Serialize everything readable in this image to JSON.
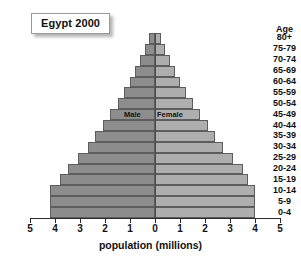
{
  "title": "Egypt 2000",
  "axis_label": "population (millions)",
  "age_header": "Age",
  "series_labels": {
    "male": "Male",
    "female": "Female"
  },
  "tick_labels": [
    "5",
    "4",
    "3",
    "2",
    "1",
    "0",
    "1",
    "2",
    "3",
    "4",
    "5"
  ],
  "colors": {
    "male_bar": "#8d8d8d",
    "female_bar": "#aeaeae",
    "bar_outline": "#5d5d5d",
    "axis": "#2b2b2b",
    "background": "#ffffff"
  },
  "chart_data": {
    "type": "bar",
    "subtype": "population-pyramid",
    "title": "Egypt 2000",
    "xlabel": "population (millions)",
    "ylabel": "Age",
    "xlim": [
      -5,
      5
    ],
    "xticks": [
      -5,
      -4,
      -3,
      -2,
      -1,
      0,
      1,
      2,
      3,
      4,
      5
    ],
    "xtick_labels": [
      "5",
      "4",
      "3",
      "2",
      "1",
      "0",
      "1",
      "2",
      "3",
      "4",
      "5"
    ],
    "grid": false,
    "legend": "inline",
    "categories": [
      "80+",
      "75-79",
      "70-74",
      "65-69",
      "60-64",
      "55-59",
      "50-54",
      "45-49",
      "40-44",
      "35-39",
      "30-34",
      "25-29",
      "20-24",
      "15-19",
      "10-14",
      "5-9",
      "0-4"
    ],
    "series": [
      {
        "name": "Male",
        "side": "left",
        "values": [
          0.25,
          0.4,
          0.6,
          0.8,
          1.0,
          1.25,
          1.5,
          1.8,
          2.1,
          2.4,
          2.7,
          3.1,
          3.5,
          3.8,
          4.2,
          4.2,
          4.2
        ]
      },
      {
        "name": "Female",
        "side": "right",
        "values": [
          0.25,
          0.4,
          0.6,
          0.8,
          1.0,
          1.25,
          1.5,
          1.8,
          2.1,
          2.4,
          2.7,
          3.1,
          3.5,
          3.7,
          4.0,
          4.0,
          4.0
        ]
      }
    ]
  }
}
